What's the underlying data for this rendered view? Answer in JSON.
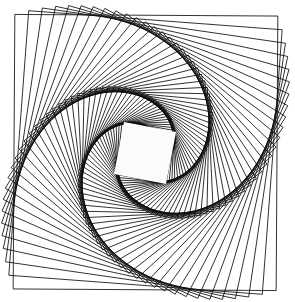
{
  "figure": {
    "kind": "geometric-line-art",
    "canvas": {
      "width": 295,
      "height": 302,
      "background_color": "#ffffff"
    },
    "stroke": {
      "color": "#0d0d0d",
      "width": 0.85,
      "linejoin": "miter"
    },
    "outer_square": {
      "left": 17,
      "top": 11.5,
      "right": 280,
      "bottom": 286,
      "width": 263,
      "height": 274.5,
      "rotation_deg": 0.35
    },
    "center": {
      "x": 145.5,
      "y": 152.5
    },
    "construction": {
      "square_count": 62,
      "rotation_step_deg": 3.95,
      "scale_step": 0.9665,
      "total_rotation_deg": 244.9,
      "spiral_arm_count": 4,
      "handedness": "clockwise"
    },
    "inner_square": {
      "center_x": 145.0,
      "center_y": 153.0,
      "half_size": 26.5,
      "rotation_deg": 11.0,
      "fill_color": "#fbfbfb",
      "stroke_color": "#101010"
    },
    "palette": {
      "line": "#0d0d0d",
      "background": "#ffffff",
      "inner_fill": "#fbfbfb",
      "arm_density": "#000000"
    }
  }
}
